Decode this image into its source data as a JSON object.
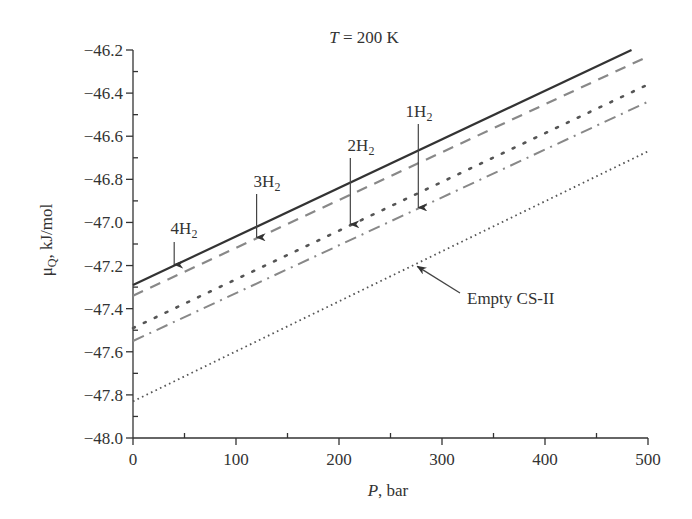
{
  "chart_data": {
    "type": "line",
    "title": "T = 200 K",
    "title_parts": {
      "var": "T",
      "rest": " = 200 K"
    },
    "xlabel": "P, bar",
    "xlabel_parts": {
      "var": "P",
      "rest": ", bar"
    },
    "ylabel": "μQ, kJ/mol",
    "ylabel_parts": {
      "main": "μ",
      "sub": "Q",
      "rest": ", kJ/mol"
    },
    "xlim": [
      0,
      500
    ],
    "ylim": [
      -48.0,
      -46.2
    ],
    "xticks": [
      0,
      100,
      200,
      300,
      400,
      500
    ],
    "xtick_labels": [
      "0",
      "100",
      "200",
      "300",
      "400",
      "500"
    ],
    "yticks": [
      -46.2,
      -46.4,
      -46.6,
      -46.8,
      -47.0,
      -47.2,
      -47.4,
      -47.6,
      -47.8,
      -48.0
    ],
    "ytick_labels": [
      "−46.2",
      "−46.4",
      "−46.6",
      "−46.8",
      "−47.0",
      "−47.2",
      "−47.4",
      "−47.6",
      "−47.8",
      "−48.0"
    ],
    "grid": false,
    "legend": "none (inline annotations)",
    "series": [
      {
        "name": "4H2",
        "style": "solid",
        "color": "#333333",
        "x": [
          0,
          484
        ],
        "y": [
          -47.29,
          -46.2
        ]
      },
      {
        "name": "3H2",
        "style": "dashed",
        "color": "#888888",
        "x": [
          0,
          500
        ],
        "y": [
          -47.34,
          -46.23
        ]
      },
      {
        "name": "2H2",
        "style": "dotted-coarse",
        "color": "#555555",
        "x": [
          0,
          500
        ],
        "y": [
          -47.49,
          -46.36
        ]
      },
      {
        "name": "1H2",
        "style": "dash-dot",
        "color": "#888888",
        "x": [
          0,
          500
        ],
        "y": [
          -47.55,
          -46.44
        ]
      },
      {
        "name": "Empty CS-II",
        "style": "dotted-fine",
        "color": "#555555",
        "x": [
          0,
          500
        ],
        "y": [
          -47.83,
          -46.67
        ]
      }
    ],
    "annotations": [
      {
        "label_main": "4H",
        "label_sub": "2",
        "text": "4H2",
        "target_series": "4H2",
        "arrow_x": 40
      },
      {
        "label_main": "3H",
        "label_sub": "2",
        "text": "3H2",
        "target_series": "3H2",
        "arrow_x": 120
      },
      {
        "label_main": "2H",
        "label_sub": "2",
        "text": "2H2",
        "target_series": "2H2",
        "arrow_x": 211
      },
      {
        "label_main": "1H",
        "label_sub": "2",
        "text": "1H2",
        "target_series": "1H2",
        "arrow_x": 277
      },
      {
        "label_main": "Empty CS-II",
        "label_sub": "",
        "text": "Empty CS-II",
        "target_series": "Empty CS-II",
        "arrow_x": 276
      }
    ]
  }
}
